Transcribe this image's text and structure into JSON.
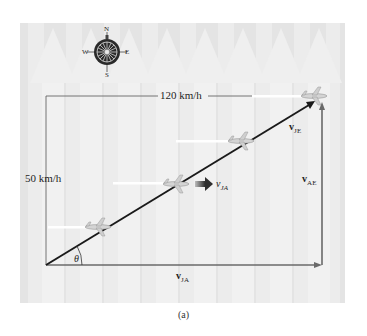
{
  "figure": {
    "caption": "(a)",
    "background_color": "#e4e4e4",
    "stripe_color": "#efefef",
    "air_arrow_color": "#f2f2f2"
  },
  "compass": {
    "north": "N",
    "south": "S",
    "east": "E",
    "west": "W"
  },
  "labels": {
    "top_speed": "120 km/h",
    "side_speed": "50 km/h",
    "theta": "θ",
    "v_je": {
      "main": "v",
      "sub": "JE"
    },
    "v_ae": {
      "main": "v",
      "sub": "AE"
    },
    "v_ja_mid": {
      "main": "v",
      "sub": "JA"
    },
    "v_ja_bottom": {
      "main": "v",
      "sub": "JA"
    }
  },
  "vectors": {
    "resultant_color": "#1a1a1a",
    "component_color": "#6a6a6a",
    "mid_arrow_color": "#3a3a3a"
  }
}
